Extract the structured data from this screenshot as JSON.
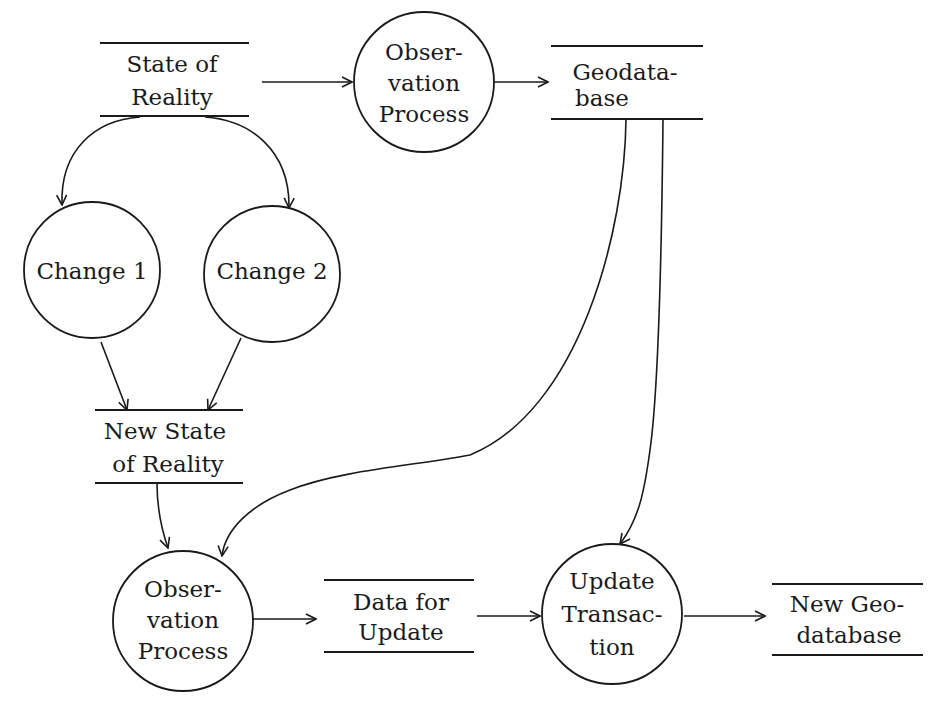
{
  "diagram": {
    "type": "data-flow-diagram",
    "colors": {
      "line": "#1a1a1a",
      "background": "#ffffff"
    },
    "nodes": {
      "state_of_reality": {
        "kind": "data-store",
        "line1": "State of",
        "line2": "Reality"
      },
      "observation_process_top": {
        "kind": "process",
        "line1": "Obser-",
        "line2": "vation",
        "line3": "Process"
      },
      "geodatabase": {
        "kind": "data-store",
        "line1": "Geodata-",
        "line2": "base"
      },
      "change_1": {
        "kind": "process",
        "line1": "Change 1"
      },
      "change_2": {
        "kind": "process",
        "line1": "Change 2"
      },
      "new_state_of_reality": {
        "kind": "data-store",
        "line1": "New State",
        "line2": "of Reality"
      },
      "observation_process_bottom": {
        "kind": "process",
        "line1": "Obser-",
        "line2": "vation",
        "line3": "Process"
      },
      "data_for_update": {
        "kind": "data-store",
        "line1": "Data for",
        "line2": "Update"
      },
      "update_transaction": {
        "kind": "process",
        "line1": "Update",
        "line2": "Transac-",
        "line3": "tion"
      },
      "new_geodatabase": {
        "kind": "data-store",
        "line1": "New Geo-",
        "line2": "database"
      }
    },
    "edges": [
      {
        "from": "State of Reality",
        "to": "Observation Process (top)"
      },
      {
        "from": "Observation Process (top)",
        "to": "Geodatabase"
      },
      {
        "from": "State of Reality",
        "to": "Change 1"
      },
      {
        "from": "State of Reality",
        "to": "Change 2"
      },
      {
        "from": "Change 1",
        "to": "New State of Reality"
      },
      {
        "from": "Change 2",
        "to": "New State of Reality"
      },
      {
        "from": "New State of Reality",
        "to": "Observation Process (bottom)"
      },
      {
        "from": "Geodatabase",
        "to": "Observation Process (bottom)"
      },
      {
        "from": "Geodatabase",
        "to": "Update Transaction"
      },
      {
        "from": "Observation Process (bottom)",
        "to": "Data for Update"
      },
      {
        "from": "Data for Update",
        "to": "Update Transaction"
      },
      {
        "from": "Update Transaction",
        "to": "New Geodatabase"
      }
    ]
  }
}
